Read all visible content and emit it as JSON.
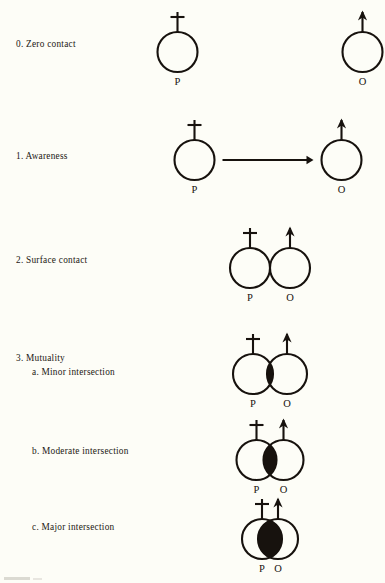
{
  "document": {
    "title": "Degrees of Interpersonal Contact",
    "ink_color": "#17120e",
    "paper_color": "#fdfdf7",
    "person_symbol_label": "P",
    "other_symbol_label": "O",
    "person_icon": "cross-topped-circle-icon",
    "other_icon": "arrow-topped-circle-icon"
  },
  "rows": [
    {
      "id": "row-0",
      "label_main": "0. Zero contact",
      "label_sub": "",
      "left_label": "P",
      "right_label": "O",
      "diagram": "two-separate-circles",
      "overlap": 0,
      "arrow": false
    },
    {
      "id": "row-1",
      "label_main": "1. Awareness",
      "label_sub": "",
      "left_label": "P",
      "right_label": "O",
      "diagram": "two-separate-circles-with-arrow",
      "overlap": 0,
      "arrow": true
    },
    {
      "id": "row-2",
      "label_main": "2. Surface contact",
      "label_sub": "",
      "left_label": "P",
      "right_label": "O",
      "diagram": "two-tangent-circles",
      "overlap": 0,
      "arrow": false
    },
    {
      "id": "row-3a",
      "label_main": "3. Mutuality",
      "label_sub": "a. Minor intersection",
      "left_label": "P",
      "right_label": "O",
      "diagram": "two-overlapping-circles-filled-lens",
      "overlap": 6,
      "arrow": false
    },
    {
      "id": "row-3b",
      "label_main": "",
      "label_sub": "b. Moderate intersection",
      "left_label": "P",
      "right_label": "O",
      "diagram": "two-overlapping-circles-filled-lens",
      "overlap": 13,
      "arrow": false
    },
    {
      "id": "row-3c",
      "label_main": "",
      "label_sub": "c. Major intersection",
      "left_label": "P",
      "right_label": "O",
      "diagram": "two-overlapping-circles-filled-lens",
      "overlap": 24,
      "arrow": false
    }
  ]
}
